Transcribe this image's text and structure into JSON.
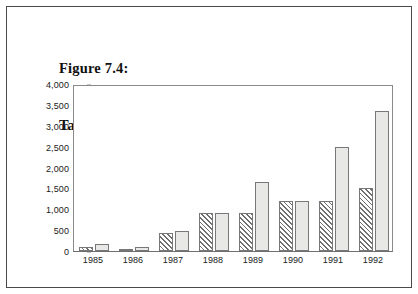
{
  "figure": {
    "title_line1": "Figure 7.4:",
    "title_line2": "Tariff increases versus inflation increases"
  },
  "chart_data": {
    "type": "bar",
    "title": "Tariff increases versus inflation increases",
    "xlabel": "",
    "ylabel": "",
    "ylim": [
      0,
      4000
    ],
    "ytick_labels": [
      "0",
      "500",
      "1,000",
      "1,500",
      "2,000",
      "2,500",
      "3,000",
      "3,500",
      "4,000"
    ],
    "ytick_values": [
      0,
      500,
      1000,
      1500,
      2000,
      2500,
      3000,
      3500,
      4000
    ],
    "grid": false,
    "legend": "none",
    "categories": [
      "1985",
      "1986",
      "1987",
      "1988",
      "1989",
      "1990",
      "1991",
      "1992"
    ],
    "series": [
      {
        "name": "Tariff increases",
        "style": "diagonal-hatch",
        "color": "#ffffff",
        "values": [
          100,
          60,
          430,
          900,
          900,
          1200,
          1200,
          1520
        ]
      },
      {
        "name": "Inflation increases",
        "style": "solid-gray",
        "color": "#e8e8e6",
        "values": [
          180,
          90,
          470,
          900,
          1650,
          1200,
          2500,
          3350
        ]
      }
    ]
  }
}
